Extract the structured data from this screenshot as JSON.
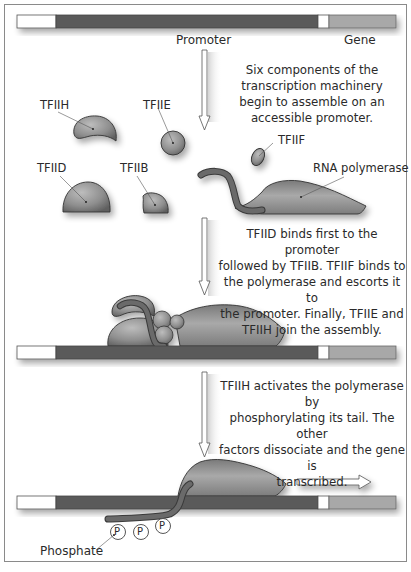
{
  "dna": {
    "promoter_label": "Promoter",
    "gene_label": "Gene",
    "colors": {
      "upstream": "#ffffff",
      "promoter": "#5a5a5a",
      "spacer": "#ffffff",
      "gene": "#a8a8a8"
    }
  },
  "steps": [
    {
      "caption": "Six components of the transcription machinery begin to assemble on an accessible promoter.",
      "caption_lines": [
        "Six components of the",
        "transcription machinery",
        "begin to assemble on an",
        "accessible promoter."
      ]
    },
    {
      "caption": "TFIID binds first to the promoter followed by TFIIB. TFIIF binds to the polymerase and escorts it to the promoter. Finally, TFIIE and TFIIH join the assembly.",
      "caption_lines": [
        "TFIID binds first to the promoter",
        "followed by TFIIB. TFIIF binds to",
        "the polymerase and escorts it to",
        "the promoter. Finally, TFIIE and",
        "TFIIH join the assembly."
      ]
    },
    {
      "caption": "TFIIH activates the polymerase by phosphorylating its tail. The other factors dissociate and the gene is transcribed.",
      "caption_lines": [
        "TFIIH activates the polymerase by",
        "phosphorylating its tail. The other",
        "factors dissociate and the gene is",
        "transcribed."
      ]
    }
  ],
  "factors": {
    "tfiih": "TFIIH",
    "tfiie": "TFIIE",
    "tfiid": "TFIID",
    "tfiib": "TFIIB",
    "tfiif": "TFIIF",
    "rna_polymerase": "RNA polymerase"
  },
  "phosphate": {
    "label": "Phosphate",
    "symbol": "P",
    "count": 3
  }
}
